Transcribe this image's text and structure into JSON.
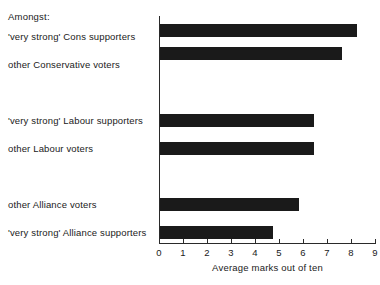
{
  "chart_data": {
    "type": "bar",
    "orientation": "horizontal",
    "title": "",
    "intro_label": "Amongst:",
    "categories": [
      "'very strong' Cons supporters",
      "other Conservative voters",
      "'very strong' Labour supporters",
      "other Labour voters",
      "other Alliance voters",
      "'very strong' Alliance supporters"
    ],
    "values": [
      8.2,
      7.6,
      6.4,
      6.4,
      5.8,
      4.7
    ],
    "xlabel": "Average marks out of ten",
    "ylabel": "",
    "xlim": [
      0,
      9
    ],
    "xticks": [
      0,
      1,
      2,
      3,
      4,
      5,
      6,
      7,
      8,
      9
    ],
    "xtick_labels": [
      "0",
      "1",
      "2",
      "3",
      "4",
      "5",
      "6",
      "7",
      "8",
      "9"
    ],
    "grid": false,
    "legend": false,
    "bar_color": "#1a1a1a",
    "axis_color": "#2a2a2a",
    "background": "#ffffff",
    "row_tops": [
      8,
      31,
      98,
      126,
      182,
      210
    ],
    "label_tops": [
      31,
      59,
      115,
      143,
      199,
      227
    ]
  }
}
